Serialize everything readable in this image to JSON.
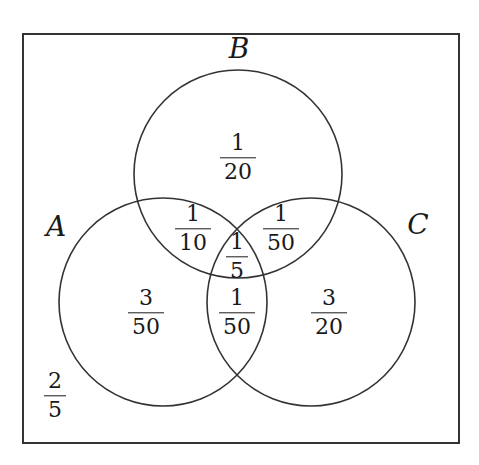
{
  "diagram": {
    "type": "venn",
    "sets": [
      {
        "name": "A",
        "label": "A",
        "cx": 163,
        "cy": 302,
        "r": 104,
        "label_x": 56,
        "label_y": 226
      },
      {
        "name": "B",
        "label": "B",
        "cx": 238,
        "cy": 174,
        "r": 104,
        "label_x": 239,
        "label_y": 48
      },
      {
        "name": "C",
        "label": "C",
        "cx": 311,
        "cy": 302,
        "r": 104,
        "label_x": 418,
        "label_y": 224
      }
    ],
    "frame": {
      "x": 23,
      "y": 34,
      "width": 436,
      "height": 409
    },
    "stroke_color": "#333333",
    "regions": [
      {
        "id": "B-only",
        "num": "1",
        "den": "20",
        "x": 238,
        "y": 158
      },
      {
        "id": "A-and-B-only",
        "num": "1",
        "den": "10",
        "x": 193,
        "y": 229
      },
      {
        "id": "B-and-C-only",
        "num": "1",
        "den": "50",
        "x": 281,
        "y": 229
      },
      {
        "id": "A-and-B-and-C",
        "num": "1",
        "den": "5",
        "x": 237,
        "y": 257
      },
      {
        "id": "A-only",
        "num": "3",
        "den": "50",
        "x": 146,
        "y": 313
      },
      {
        "id": "A-and-C-only",
        "num": "1",
        "den": "50",
        "x": 237,
        "y": 313
      },
      {
        "id": "C-only",
        "num": "3",
        "den": "20",
        "x": 329,
        "y": 313
      },
      {
        "id": "outside",
        "num": "2",
        "den": "5",
        "x": 55,
        "y": 396
      }
    ]
  }
}
